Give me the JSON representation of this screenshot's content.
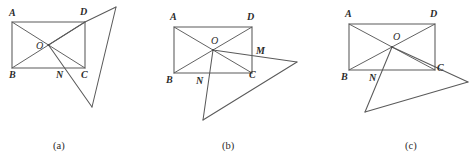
{
  "figure": {
    "stroke_color": "#5a5a5a",
    "label_color": "#2b2b2b",
    "background": "#ffffff"
  },
  "panels": [
    {
      "id": "a",
      "caption": "(a)",
      "caption_x": 53,
      "caption_y": 141,
      "rect": {
        "left": 12,
        "top": 22,
        "right": 85,
        "bottom": 68
      },
      "points": {
        "A": {
          "x": 12,
          "y": 22
        },
        "B": {
          "x": 12,
          "y": 68
        },
        "C": {
          "x": 85,
          "y": 68
        },
        "D": {
          "x": 85,
          "y": 22
        },
        "O": {
          "x": 48.5,
          "y": 45
        },
        "N": {
          "x": 62,
          "y": 68
        },
        "P": {
          "x": 116,
          "y": 7
        },
        "Q": {
          "x": 92,
          "y": 107
        }
      },
      "labels": [
        {
          "text": "A",
          "x": 9,
          "y": 8,
          "bold": true
        },
        {
          "text": "D",
          "x": 80,
          "y": 7,
          "bold": true
        },
        {
          "text": "B",
          "x": 9,
          "y": 70,
          "bold": true
        },
        {
          "text": "C",
          "x": 81,
          "y": 70,
          "bold": true
        },
        {
          "text": "O",
          "x": 36,
          "y": 41,
          "bold": false
        },
        {
          "text": "N",
          "x": 56,
          "y": 70,
          "bold": true
        }
      ]
    },
    {
      "id": "b",
      "caption": "(b)",
      "caption_x": 222,
      "caption_y": 141,
      "rect": {
        "left": 174,
        "top": 27,
        "right": 252,
        "bottom": 73
      },
      "points": {
        "A": {
          "x": 174,
          "y": 27
        },
        "B": {
          "x": 174,
          "y": 73
        },
        "C": {
          "x": 252,
          "y": 73
        },
        "D": {
          "x": 252,
          "y": 27
        },
        "O": {
          "x": 213,
          "y": 50
        },
        "M": {
          "x": 252,
          "y": 57
        },
        "N": {
          "x": 209,
          "y": 73
        },
        "P": {
          "x": 297,
          "y": 62
        },
        "Q": {
          "x": 203,
          "y": 120
        }
      },
      "labels": [
        {
          "text": "A",
          "x": 170,
          "y": 12,
          "bold": true
        },
        {
          "text": "D",
          "x": 247,
          "y": 12,
          "bold": true
        },
        {
          "text": "B",
          "x": 166,
          "y": 75,
          "bold": true
        },
        {
          "text": "C",
          "x": 249,
          "y": 70,
          "bold": true
        },
        {
          "text": "O",
          "x": 211,
          "y": 36,
          "bold": false
        },
        {
          "text": "M",
          "x": 256,
          "y": 46,
          "bold": true
        },
        {
          "text": "N",
          "x": 196,
          "y": 76,
          "bold": true
        }
      ]
    },
    {
      "id": "c",
      "caption": "(c)",
      "caption_x": 405,
      "caption_y": 141,
      "rect": {
        "left": 349,
        "top": 24,
        "right": 435,
        "bottom": 70
      },
      "points": {
        "A": {
          "x": 349,
          "y": 24
        },
        "B": {
          "x": 349,
          "y": 70
        },
        "C": {
          "x": 435,
          "y": 70
        },
        "D": {
          "x": 435,
          "y": 24
        },
        "O": {
          "x": 392,
          "y": 47
        },
        "N": {
          "x": 376,
          "y": 70
        },
        "P": {
          "x": 468,
          "y": 82
        },
        "Q": {
          "x": 365,
          "y": 112
        }
      },
      "labels": [
        {
          "text": "A",
          "x": 345,
          "y": 9,
          "bold": true
        },
        {
          "text": "D",
          "x": 430,
          "y": 9,
          "bold": true
        },
        {
          "text": "B",
          "x": 341,
          "y": 72,
          "bold": true
        },
        {
          "text": "C",
          "x": 437,
          "y": 63,
          "bold": true
        },
        {
          "text": "O",
          "x": 393,
          "y": 32,
          "bold": false
        },
        {
          "text": "N",
          "x": 369,
          "y": 73,
          "bold": true
        }
      ]
    }
  ]
}
